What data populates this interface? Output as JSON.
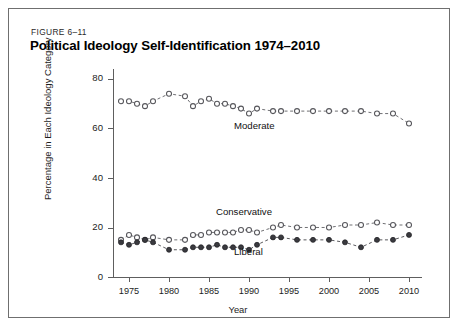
{
  "figure": {
    "label": "FIGURE 6–11",
    "title": "Political Ideology Self-Identification 1974–2010"
  },
  "chart_data": {
    "type": "line",
    "title": "Political Ideology Self-Identification 1974–2010",
    "xlabel": "Year",
    "ylabel": "Percentage in Each Ideology Category",
    "xlim": [
      1973,
      2011.5
    ],
    "ylim": [
      0,
      84
    ],
    "xticks": [
      1975,
      1980,
      1985,
      1990,
      1995,
      2000,
      2005,
      2010
    ],
    "yticks": [
      0,
      20,
      40,
      60,
      80
    ],
    "grid": false,
    "legend_position": "inline-annotations",
    "x": [
      1974,
      1975,
      1976,
      1977,
      1978,
      1980,
      1982,
      1983,
      1984,
      1985,
      1986,
      1987,
      1988,
      1989,
      1990,
      1991,
      1993,
      1994,
      1996,
      1998,
      2000,
      2002,
      2004,
      2006,
      2008,
      2010
    ],
    "series": [
      {
        "name": "Moderate",
        "marker": "open-circle",
        "color": "#55555a",
        "values": [
          71,
          71,
          70,
          69,
          71,
          74,
          73,
          69,
          71,
          72,
          70,
          70,
          69,
          68,
          66,
          68,
          67,
          67,
          67,
          67,
          67,
          67,
          67,
          66,
          66,
          62
        ]
      },
      {
        "name": "Conservative",
        "marker": "open-circle",
        "color": "#55555a",
        "values": [
          15,
          17,
          16,
          15,
          16,
          15,
          15,
          17,
          17,
          18,
          18,
          18,
          18,
          19,
          19,
          18,
          20,
          21,
          20,
          20,
          20,
          21,
          21,
          22,
          21,
          21
        ]
      },
      {
        "name": "Liberal",
        "marker": "filled-circle",
        "color": "#3a3a3f",
        "values": [
          14,
          13,
          14,
          15,
          14,
          11,
          11,
          12,
          12,
          12,
          13,
          12,
          12,
          12,
          11,
          13,
          16,
          16,
          15,
          15,
          15,
          14,
          12,
          15,
          15,
          17
        ]
      }
    ]
  }
}
